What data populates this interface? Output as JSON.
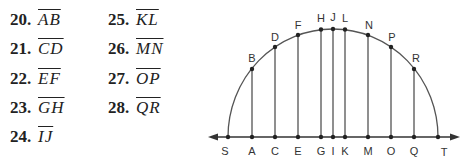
{
  "exercises": [
    {
      "number": "20.",
      "segment": "AB"
    },
    {
      "number": "21.",
      "segment": "CD"
    },
    {
      "number": "22.",
      "segment": "EF"
    },
    {
      "number": "23.",
      "segment": "GH"
    },
    {
      "number": "24.",
      "segment": "IJ"
    },
    {
      "number": "25.",
      "segment": "KL"
    },
    {
      "number": "26.",
      "segment": "MN"
    },
    {
      "number": "27.",
      "segment": "OP"
    },
    {
      "number": "28.",
      "segment": "QR"
    }
  ],
  "diagram": {
    "axis_labels": [
      "S",
      "A",
      "C",
      "E",
      "G",
      "I",
      "K",
      "M",
      "O",
      "Q",
      "T"
    ],
    "arc_labels": [
      "B",
      "D",
      "F",
      "H",
      "J",
      "L",
      "N",
      "P",
      "R"
    ],
    "line_color": "#333333",
    "arc_color": "#555555"
  }
}
